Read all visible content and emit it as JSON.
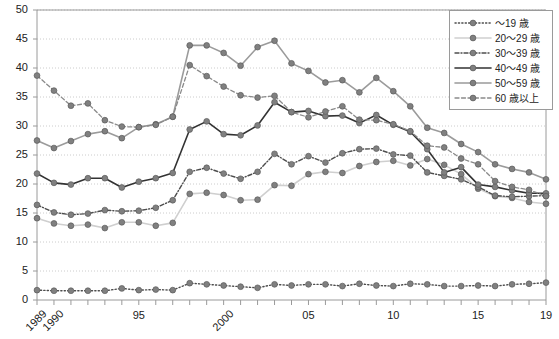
{
  "chart": {
    "type": "line",
    "title": "",
    "xlabel": "",
    "ylabel": ""
  },
  "legend": {
    "position": "top-right",
    "entries": [
      {
        "label": "～19 歳",
        "key": "u19",
        "icon": "dotted-line-marker-icon"
      },
      {
        "label": "20～29 歳",
        "key": "a20",
        "icon": "solid-light-line-marker-icon"
      },
      {
        "label": "30～39 歳",
        "key": "a30",
        "icon": "dash-dot-line-marker-icon"
      },
      {
        "label": "40～49 歳",
        "key": "a40",
        "icon": "solid-dark-line-marker-icon"
      },
      {
        "label": "50～59 歳",
        "key": "a50",
        "icon": "solid-gray-line-marker-icon"
      },
      {
        "label": "60 歳以上",
        "key": "a60",
        "icon": "dashed-line-marker-icon"
      }
    ]
  },
  "axes": {
    "y_ticks": [
      "0",
      "5",
      "10",
      "15",
      "20",
      "25",
      "30",
      "35",
      "40",
      "45",
      "50"
    ],
    "y_min": 0,
    "y_max": 50,
    "y_step": 5,
    "x_tick_labels": [
      {
        "value": 1989,
        "text": "1989",
        "rotated": true
      },
      {
        "value": 1990,
        "text": "1990",
        "rotated": true
      },
      {
        "value": 1995,
        "text": "95",
        "rotated": false
      },
      {
        "value": 2000,
        "text": "2000",
        "rotated": true
      },
      {
        "value": 2005,
        "text": "05",
        "rotated": false
      },
      {
        "value": 2010,
        "text": "10",
        "rotated": false
      },
      {
        "value": 2015,
        "text": "15",
        "rotated": false
      },
      {
        "value": 2019,
        "text": "19",
        "rotated": false
      }
    ],
    "grid": true
  },
  "colors": {
    "marker": "#808080",
    "marker_edge": "#5a5a5a",
    "line_dark": "#333333",
    "line_gray": "#8c8c8c",
    "line_light": "#cccccc",
    "grid": "#bfbfbf",
    "frame": "#9a9a9a",
    "text": "#222222"
  },
  "chart_data": {
    "type": "line",
    "title": "",
    "xlabel": "",
    "ylabel": "",
    "ylim": [
      0,
      50
    ],
    "grid": true,
    "legend_position": "top-right",
    "x": [
      1989,
      1990,
      1991,
      1992,
      1993,
      1994,
      1995,
      1996,
      1997,
      1998,
      1999,
      2000,
      2001,
      2002,
      2003,
      2004,
      2005,
      2006,
      2007,
      2008,
      2009,
      2010,
      2011,
      2012,
      2013,
      2014,
      2015,
      2016,
      2017,
      2018,
      2019
    ],
    "categories": [
      "1989",
      "1990",
      "1991",
      "1992",
      "1993",
      "1994",
      "1995",
      "1996",
      "1997",
      "1998",
      "1999",
      "2000",
      "2001",
      "2002",
      "2003",
      "2004",
      "2005",
      "2006",
      "2007",
      "2008",
      "2009",
      "2010",
      "2011",
      "2012",
      "2013",
      "2014",
      "2015",
      "2016",
      "2017",
      "2018",
      "2019"
    ],
    "series": [
      {
        "name": "～19 歳",
        "style": "dotted",
        "color": "#4d4d4d",
        "values": [
          1.7,
          1.6,
          1.6,
          1.6,
          1.6,
          2.0,
          1.7,
          1.8,
          1.7,
          2.9,
          2.7,
          2.5,
          2.3,
          2.1,
          2.7,
          2.5,
          2.7,
          2.7,
          2.4,
          2.8,
          2.5,
          2.4,
          2.8,
          2.7,
          2.4,
          2.4,
          2.5,
          2.4,
          2.7,
          2.8,
          3.0
        ]
      },
      {
        "name": "20～29 歳",
        "style": "solid-light",
        "color": "#cfcfcf",
        "values": [
          14.1,
          13.2,
          12.8,
          13.0,
          12.4,
          13.4,
          13.4,
          12.8,
          13.3,
          18.3,
          18.5,
          18.1,
          17.2,
          17.3,
          19.8,
          19.7,
          21.7,
          22.1,
          21.9,
          23.1,
          23.8,
          24.0,
          23.2,
          24.3,
          23.3,
          21.7,
          19.2,
          17.9,
          17.6,
          16.9,
          16.6
        ]
      },
      {
        "name": "30～39 歳",
        "style": "dash-dot",
        "color": "#4d4d4d",
        "values": [
          16.4,
          15.1,
          14.7,
          14.9,
          15.5,
          15.3,
          15.4,
          15.9,
          17.2,
          22.1,
          22.8,
          21.8,
          20.9,
          22.1,
          25.2,
          23.4,
          24.8,
          23.7,
          25.3,
          26.0,
          26.1,
          25.1,
          24.9,
          22.0,
          21.4,
          20.8,
          19.5,
          18.0,
          17.8,
          17.9,
          18.0
        ]
      },
      {
        "name": "40～49 歳",
        "style": "solid-dark",
        "color": "#333333",
        "values": [
          21.8,
          20.2,
          19.9,
          21.0,
          21.0,
          19.4,
          20.4,
          21.0,
          21.9,
          29.4,
          30.8,
          28.6,
          28.4,
          30.1,
          34.1,
          32.4,
          32.6,
          31.7,
          31.8,
          30.5,
          31.9,
          30.2,
          29.0,
          26.0,
          22.0,
          22.9,
          19.9,
          19.5,
          18.9,
          18.4,
          18.4
        ]
      },
      {
        "name": "50～59 歳",
        "style": "solid-gray",
        "color": "#9b9b9b",
        "values": [
          27.5,
          26.2,
          27.4,
          28.6,
          29.1,
          27.9,
          29.8,
          30.3,
          31.6,
          43.9,
          43.9,
          42.6,
          40.4,
          43.6,
          44.7,
          40.8,
          39.5,
          37.5,
          37.9,
          35.8,
          38.3,
          36.0,
          33.4,
          29.7,
          28.8,
          26.9,
          25.5,
          23.4,
          22.6,
          22.0,
          20.8
        ]
      },
      {
        "name": "60 歳以上",
        "style": "dashed",
        "color": "#777777",
        "values": [
          38.7,
          36.1,
          33.5,
          33.9,
          31.0,
          29.9,
          29.8,
          30.2,
          31.6,
          40.5,
          38.6,
          36.8,
          35.3,
          34.9,
          35.2,
          32.4,
          31.5,
          32.5,
          33.4,
          31.1,
          31.0,
          30.3,
          29.1,
          26.6,
          26.3,
          24.4,
          23.4,
          20.5,
          19.5,
          19.0,
          17.9
        ]
      }
    ]
  }
}
